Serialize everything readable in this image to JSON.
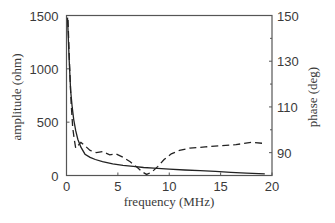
{
  "chart_data": {
    "type": "line",
    "title": "",
    "xlabel": "frequency (MHz)",
    "ylabel": "amplitude (ohm)",
    "y2label": "phase (deg)",
    "xlim": [
      0,
      20
    ],
    "ylim": [
      0,
      1500
    ],
    "y2lim": [
      80,
      150
    ],
    "x_ticks": [
      0,
      5,
      10,
      15,
      20
    ],
    "y_ticks": [
      0,
      500,
      1000,
      1500
    ],
    "y2_ticks": [
      90,
      110,
      130,
      150
    ],
    "y2_minor_ticks": [
      100,
      120,
      140
    ],
    "grid": false,
    "legend": null,
    "series": [
      {
        "name": "amplitude",
        "axis": "left",
        "style": "solid",
        "x": [
          0.1,
          0.25,
          0.4,
          0.55,
          0.7,
          0.9,
          1.1,
          1.4,
          1.8,
          2.3,
          2.8,
          3.5,
          4.5,
          5.5,
          6.5,
          7.5,
          8.5,
          10,
          11.5,
          13,
          14.5,
          16,
          17.5,
          19.3
        ],
        "y": [
          1480,
          1100,
          800,
          640,
          525,
          420,
          340,
          265,
          200,
          170,
          150,
          130,
          110,
          95,
          85,
          75,
          68,
          60,
          52,
          45,
          38,
          30,
          22,
          15
        ]
      },
      {
        "name": "phase",
        "axis": "right",
        "style": "dashed",
        "x": [
          0.15,
          0.3,
          0.45,
          0.6,
          0.75,
          0.9,
          1.1,
          1.4,
          1.8,
          2.3,
          2.9,
          3.5,
          4.2,
          4.8,
          5.5,
          6.2,
          6.9,
          7.4,
          7.8,
          8.3,
          8.9,
          9.5,
          10.2,
          11,
          12,
          13.5,
          15,
          16.5,
          18,
          19.3
        ],
        "y": [
          148,
          128,
          112,
          101,
          96,
          92,
          93,
          94.5,
          93,
          91,
          90,
          90.5,
          89,
          89.5,
          88,
          86,
          83.5,
          81.5,
          80.5,
          81.5,
          84,
          87,
          89.5,
          91,
          92,
          92.5,
          93,
          93.5,
          94.5,
          94
        ]
      }
    ]
  },
  "labels": {
    "xlabel": "frequency (MHz)",
    "ylabel": "amplitude (ohm)",
    "y2label": "phase (deg)"
  }
}
